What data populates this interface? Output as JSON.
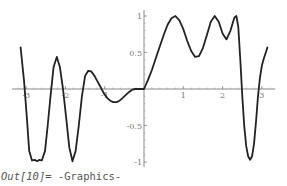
{
  "output": {
    "prompt": "Out[10]=",
    "value": "-Graphics-"
  },
  "chart_data": {
    "type": "line",
    "title": "",
    "xlabel": "",
    "ylabel": "",
    "xlim": [
      -3.2,
      3.3
    ],
    "ylim": [
      -1.05,
      1.05
    ],
    "grid": false,
    "legend": null,
    "x_ticks": [
      -3,
      -2,
      -1,
      1,
      2,
      3
    ],
    "x_tick_labels": [
      "-3",
      "-2",
      "-1",
      "1",
      "2",
      "3"
    ],
    "y_ticks": [
      1,
      0.5,
      -0.5,
      -1
    ],
    "y_tick_labels": [
      "1",
      "0.5",
      "-0.5",
      "-1"
    ],
    "series": [
      {
        "name": "f(x)",
        "color": "#222222",
        "x": [
          -3.14,
          -3.05,
          -2.98,
          -2.92,
          -2.85,
          -2.78,
          -2.72,
          -2.66,
          -2.6,
          -2.52,
          -2.45,
          -2.38,
          -2.3,
          -2.22,
          -2.14,
          -2.06,
          -1.98,
          -1.9,
          -1.82,
          -1.74,
          -1.66,
          -1.58,
          -1.5,
          -1.42,
          -1.34,
          -1.26,
          -1.18,
          -1.1,
          -1.02,
          -0.94,
          -0.86,
          -0.78,
          -0.7,
          -0.62,
          -0.54,
          -0.46,
          -0.38,
          -0.3,
          -0.22,
          -0.14,
          -0.06,
          0.0,
          0.1,
          0.2,
          0.3,
          0.4,
          0.5,
          0.6,
          0.7,
          0.8,
          0.9,
          1.0,
          1.1,
          1.2,
          1.3,
          1.4,
          1.5,
          1.6,
          1.7,
          1.8,
          1.9,
          2.0,
          2.1,
          2.2,
          2.3,
          2.35,
          2.4,
          2.45,
          2.5,
          2.55,
          2.6,
          2.65,
          2.7,
          2.75,
          2.8,
          2.85,
          2.9,
          2.95,
          3.0,
          3.05,
          3.1,
          3.14
        ],
        "y": [
          0.57,
          0.1,
          -0.4,
          -0.85,
          -0.98,
          -0.97,
          -0.99,
          -0.97,
          -0.98,
          -0.85,
          -0.5,
          -0.1,
          0.3,
          0.44,
          0.3,
          0.0,
          -0.4,
          -0.8,
          -0.99,
          -0.85,
          -0.5,
          -0.1,
          0.18,
          0.25,
          0.24,
          0.18,
          0.1,
          0.02,
          -0.06,
          -0.12,
          -0.16,
          -0.18,
          -0.18,
          -0.16,
          -0.12,
          -0.08,
          -0.04,
          -0.01,
          0.0,
          0.0,
          0.0,
          0.0,
          0.12,
          0.26,
          0.42,
          0.58,
          0.74,
          0.88,
          0.97,
          1.0,
          0.94,
          0.82,
          0.66,
          0.52,
          0.44,
          0.45,
          0.56,
          0.74,
          0.92,
          1.0,
          0.92,
          0.76,
          0.68,
          0.8,
          0.98,
          1.0,
          0.85,
          0.4,
          -0.1,
          -0.5,
          -0.78,
          -0.92,
          -0.97,
          -0.92,
          -0.75,
          -0.45,
          -0.1,
          0.15,
          0.32,
          0.42,
          0.5,
          0.57
        ]
      }
    ]
  }
}
